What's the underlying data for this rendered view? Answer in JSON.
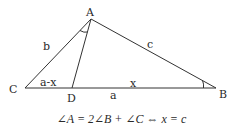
{
  "diagram": {
    "type": "triangle-geometry",
    "colors": {
      "stroke": "#333333",
      "text": "#2a2a2a",
      "background": "#ffffff"
    },
    "vertices": {
      "A": {
        "label": "A",
        "x": 91,
        "y": 19
      },
      "B": {
        "label": "B",
        "x": 216,
        "y": 88
      },
      "C": {
        "label": "C",
        "x": 25,
        "y": 88
      },
      "D": {
        "label": "D",
        "x": 72,
        "y": 88
      }
    },
    "segments": [
      {
        "from": "A",
        "to": "B",
        "label": "c"
      },
      {
        "from": "A",
        "to": "C",
        "label": "b"
      },
      {
        "from": "C",
        "to": "B",
        "label": "a"
      },
      {
        "from": "A",
        "to": "D",
        "label": ""
      },
      {
        "from": "C",
        "to": "D",
        "label": "a-x"
      },
      {
        "from": "D",
        "to": "B",
        "label": "x"
      }
    ],
    "side_labels": {
      "b": "b",
      "c": "c",
      "a": "a",
      "a_minus_x": "a-x",
      "x": "x"
    },
    "angle_marks": [
      {
        "vertex": "A",
        "between": [
          "AC",
          "AD"
        ]
      },
      {
        "vertex": "B",
        "between": [
          "BA",
          "BC"
        ]
      }
    ],
    "formula": "∠A = 2∠B + ∠C ⇔ x = c"
  }
}
